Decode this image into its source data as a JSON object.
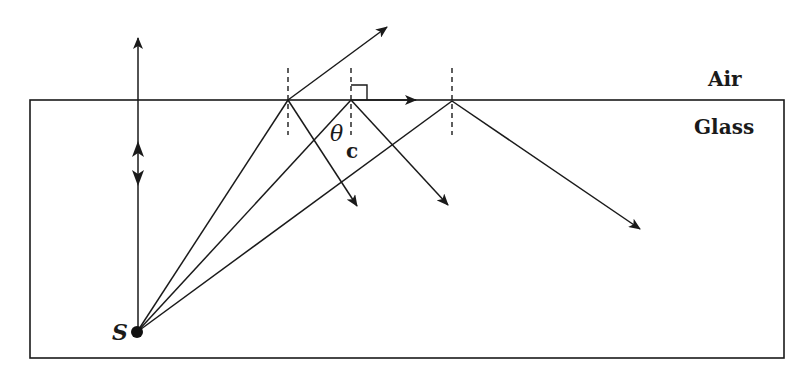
{
  "diagram": {
    "labels": {
      "upper_medium": "Air",
      "lower_medium": "Glass",
      "source": "S",
      "critical_angle_symbol": "θ",
      "critical_angle_subscript": "c"
    },
    "colors": {
      "line": "#1a1a1a",
      "background": "#ffffff"
    },
    "geometry": {
      "boundary_rect": {
        "x1": 30,
        "y1": 100,
        "x2": 784,
        "y2": 358
      },
      "source_point": {
        "x": 137,
        "y": 332
      },
      "incidence_points": [
        {
          "name": "below-critical",
          "x": 288,
          "y": 100
        },
        {
          "name": "at-critical",
          "x": 351,
          "y": 100
        },
        {
          "name": "above-critical",
          "x": 452,
          "y": 101
        }
      ]
    },
    "rays": [
      {
        "name": "normal-ray",
        "description": "Ray along the normal, passes straight through into air"
      },
      {
        "name": "ray-1",
        "description": "Refracted into air and partially reflected into glass"
      },
      {
        "name": "ray-2",
        "description": "At critical angle: refracted ray grazes surface (90°), partially reflected"
      },
      {
        "name": "ray-3",
        "description": "Beyond critical angle: totally internally reflected"
      }
    ]
  }
}
